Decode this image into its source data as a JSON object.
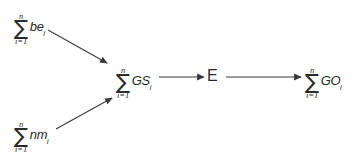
{
  "diagram": {
    "type": "flow-diagram",
    "background_color": "#ffffff",
    "line_color": "#3a3a3a",
    "text_color": "#2a2a2a",
    "nodes": [
      {
        "id": "be",
        "kind": "summation",
        "sigma": "∑",
        "upper_limit": "n",
        "lower_limit": "i=1",
        "body": "be",
        "subscript": "i",
        "label": "∑ beᵢ"
      },
      {
        "id": "nm",
        "kind": "summation",
        "sigma": "∑",
        "upper_limit": "n",
        "lower_limit": "i=1",
        "body": "nm",
        "subscript": "i",
        "label": "∑ nmᵢ"
      },
      {
        "id": "gs",
        "kind": "summation",
        "sigma": "∑",
        "upper_limit": "n",
        "lower_limit": "i=1",
        "body": "GS",
        "subscript": "i",
        "label": "∑ GSᵢ"
      },
      {
        "id": "e",
        "kind": "plain",
        "label": "E"
      },
      {
        "id": "go",
        "kind": "summation",
        "sigma": "∑",
        "upper_limit": "n",
        "lower_limit": "i=1",
        "body": "GO",
        "subscript": "i",
        "label": "∑ GOᵢ"
      }
    ],
    "edges": [
      {
        "id": "edge-be-gs",
        "from": "be",
        "to": "gs",
        "style": "solid-arrow"
      },
      {
        "id": "edge-nm-gs",
        "from": "nm",
        "to": "gs",
        "style": "solid-arrow"
      },
      {
        "id": "edge-gs-e",
        "from": "gs",
        "to": "e",
        "style": "solid-arrow"
      },
      {
        "id": "edge-e-go",
        "from": "e",
        "to": "go",
        "style": "solid-arrow"
      }
    ]
  }
}
